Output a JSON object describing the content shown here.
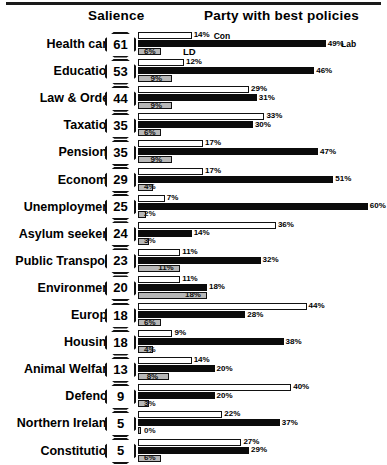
{
  "header": {
    "salience_label": "Salience",
    "party_label": "Party with best policies"
  },
  "legend": {
    "con": "Con",
    "lab": "Lab",
    "ld": "LD"
  },
  "chart_data": {
    "type": "bar",
    "orientation": "horizontal",
    "title": "Party with best policies",
    "subtitle": "Salience",
    "xlabel": "",
    "ylabel": "",
    "xlim": [
      0,
      65
    ],
    "grid": false,
    "legend_position": "inline-first-row",
    "value_suffix": "%",
    "categories": [
      "Health care",
      "Education",
      "Law & Order",
      "Taxation",
      "Pensions",
      "Economy",
      "Unemployment",
      "Asylum seekers",
      "Public Transport",
      "Environment",
      "Europe",
      "Housing",
      "Animal Welfare",
      "Defence",
      "Northern Ireland",
      "Constitution"
    ],
    "salience": [
      61,
      53,
      44,
      35,
      35,
      29,
      25,
      24,
      23,
      20,
      18,
      18,
      13,
      9,
      5,
      5
    ],
    "series": [
      {
        "name": "Con",
        "color": "#ffffff",
        "values": [
          14,
          12,
          29,
          33,
          17,
          17,
          7,
          36,
          11,
          11,
          44,
          9,
          14,
          40,
          22,
          27
        ]
      },
      {
        "name": "Lab",
        "color": "#0b0b0b",
        "values": [
          49,
          46,
          31,
          30,
          47,
          51,
          60,
          14,
          32,
          18,
          28,
          38,
          20,
          20,
          37,
          29
        ]
      },
      {
        "name": "LD",
        "color": "#b8b8b8",
        "values": [
          6,
          9,
          9,
          6,
          9,
          4,
          2,
          3,
          11,
          18,
          6,
          4,
          8,
          3,
          0,
          6
        ]
      }
    ]
  },
  "rows": [
    {
      "label": "Health care",
      "salience": "61",
      "con": "14%",
      "lab": "49%",
      "ld": "6%"
    },
    {
      "label": "Education",
      "salience": "53",
      "con": "12%",
      "lab": "46%",
      "ld": "9%"
    },
    {
      "label": "Law & Order",
      "salience": "44",
      "con": "29%",
      "lab": "31%",
      "ld": "9%"
    },
    {
      "label": "Taxation",
      "salience": "35",
      "con": "33%",
      "lab": "30%",
      "ld": "6%"
    },
    {
      "label": "Pensions",
      "salience": "35",
      "con": "17%",
      "lab": "47%",
      "ld": "9%"
    },
    {
      "label": "Economy",
      "salience": "29",
      "con": "17%",
      "lab": "51%",
      "ld": "4%"
    },
    {
      "label": "Unemployment",
      "salience": "25",
      "con": "7%",
      "lab": "60%",
      "ld": "2%"
    },
    {
      "label": "Asylum seekers",
      "salience": "24",
      "con": "36%",
      "lab": "14%",
      "ld": "3%"
    },
    {
      "label": "Public Transport",
      "salience": "23",
      "con": "11%",
      "lab": "32%",
      "ld": "11%"
    },
    {
      "label": "Environment",
      "salience": "20",
      "con": "11%",
      "lab": "18%",
      "ld": "18%"
    },
    {
      "label": "Europe",
      "salience": "18",
      "con": "44%",
      "lab": "28%",
      "ld": "6%"
    },
    {
      "label": "Housing",
      "salience": "18",
      "con": "9%",
      "lab": "38%",
      "ld": "4%"
    },
    {
      "label": "Animal Welfare",
      "salience": "13",
      "con": "14%",
      "lab": "20%",
      "ld": "8%"
    },
    {
      "label": "Defence",
      "salience": "9",
      "con": "40%",
      "lab": "20%",
      "ld": "3%"
    },
    {
      "label": "Northern Ireland",
      "salience": "5",
      "con": "22%",
      "lab": "37%",
      "ld": "0%"
    },
    {
      "label": "Constitution",
      "salience": "5",
      "con": "27%",
      "lab": "29%",
      "ld": "6%"
    }
  ]
}
